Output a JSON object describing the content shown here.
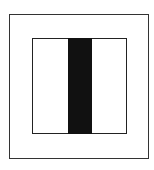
{
  "diagram": {
    "background": "#ffffff",
    "outer_frame": {
      "x": 9,
      "y": 14,
      "w": 140,
      "h": 145,
      "stroke": "#333333",
      "stroke_width": 1.5
    },
    "inner_frame": {
      "x": 32,
      "y": 38,
      "w": 95,
      "h": 96,
      "stroke": "#222222",
      "stroke_width": 1.5
    },
    "center_bar": {
      "x": 68,
      "y": 38,
      "w": 24,
      "h": 96,
      "fill": "#111111"
    }
  }
}
